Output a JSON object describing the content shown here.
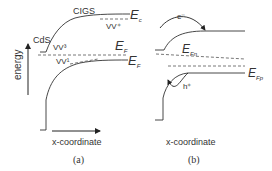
{
  "panels": [
    {
      "id": "a",
      "caption": "(a)",
      "x_label": "x-coordinate",
      "y_label": "energy",
      "region_labels": {
        "left": "CdS",
        "right": "CIGS"
      },
      "levels": {
        "conduction": {
          "sym": "E",
          "sub": "c"
        },
        "fermi": {
          "sym": "E",
          "sub": "F"
        },
        "valence": {
          "sym": "E",
          "sub": "F"
        }
      },
      "defects": [
        "VV³",
        "VV¹",
        "VV⁺"
      ]
    },
    {
      "id": "b",
      "caption": "(b)",
      "x_label": "x-coordinate",
      "levels": {
        "electron_quasi_fermi": {
          "sym": "E",
          "sub": "Fn"
        },
        "hole_quasi_fermi": {
          "sym": "E",
          "sub": "Fp"
        }
      },
      "carriers": {
        "electron": "e⁻",
        "hole": "h⁺"
      }
    }
  ],
  "colors": {
    "line": "#333333",
    "dashed": "#555555",
    "text": "#333333"
  }
}
